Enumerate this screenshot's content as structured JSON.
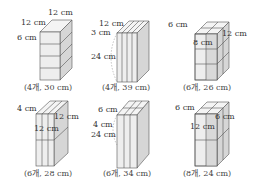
{
  "figures": [
    {
      "id": "a",
      "labels": [
        "12 cm",
        "12 cm",
        "6 cm"
      ],
      "caption": "(4개, 30 cm)"
    },
    {
      "id": "b",
      "labels": [
        "12 cm",
        "3 cm",
        "24 cm"
      ],
      "caption": "(4개, 39 cm)"
    },
    {
      "id": "c",
      "labels": [
        "6 cm",
        "12 cm",
        "8 cm"
      ],
      "caption": "(6개, 26 cm)"
    },
    {
      "id": "d",
      "labels": [
        "4 cm",
        "12 cm",
        "12 cm"
      ],
      "caption": "(6개, 28 cm)"
    },
    {
      "id": "e",
      "labels": [
        "6 cm",
        "4 cm",
        "24 cm"
      ],
      "caption": "(6개, 34 cm)"
    },
    {
      "id": "f",
      "labels": [
        "6 cm",
        "6 cm",
        "12 cm"
      ],
      "caption": "(8개, 24 cm)"
    }
  ]
}
